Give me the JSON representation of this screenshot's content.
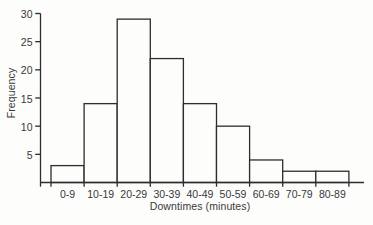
{
  "figure": {
    "background": "#fdfdfc",
    "line_color": "#2d2d2d",
    "text_color": "#383838",
    "bar_fill": "#fdfdfc"
  },
  "chart_data": {
    "type": "bar",
    "subtype": "histogram",
    "categories": [
      "0-9",
      "10-19",
      "20-29",
      "30-39",
      "40-49",
      "50-59",
      "60-69",
      "70-79",
      "80-89"
    ],
    "values": [
      3,
      14,
      29,
      22,
      14,
      10,
      4,
      2,
      2
    ],
    "xlabel": "Downtimes (minutes)",
    "ylabel": "Frequency",
    "yticks": [
      5,
      10,
      15,
      20,
      25,
      30
    ],
    "ylim": [
      0,
      30
    ],
    "grid": false,
    "legend": false,
    "bar_gap": 0
  }
}
